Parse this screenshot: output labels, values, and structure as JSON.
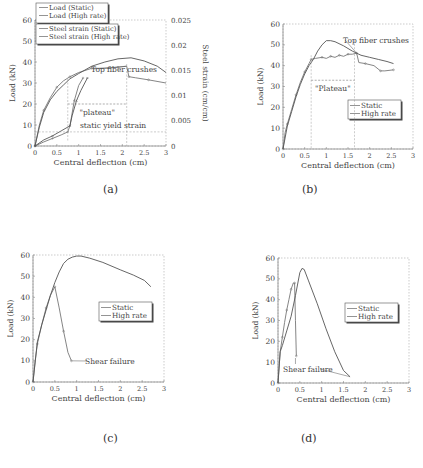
{
  "chart_data": [
    {
      "id": "a",
      "type": "line",
      "caption": "(a)",
      "xlabel": "Central deflection (cm)",
      "ylabel": "Load (kN)",
      "y2label": "Steel strain (cm/cm)",
      "xlim": [
        0,
        3
      ],
      "ylim": [
        0,
        60
      ],
      "y2lim": [
        0,
        0.025
      ],
      "xticks": [
        "0",
        "0.5",
        "1",
        "1.5",
        "2",
        "2.5",
        "3"
      ],
      "yticks": [
        "0",
        "10",
        "20",
        "30",
        "40",
        "50",
        "60"
      ],
      "y2ticks": [
        "0",
        "0.005",
        "0.01",
        "0.015",
        "0.02",
        "0.025"
      ],
      "grid": "dotted",
      "legend": [
        "Load (Static)",
        "Load (High rate)",
        "Steel strain (Static)",
        "Steel strain (High rate)"
      ],
      "legend_position": "top-left",
      "series": [
        {
          "name": "Load (Static)",
          "axis": "left",
          "x": [
            0,
            0.1,
            0.2,
            0.35,
            0.5,
            0.65,
            0.8,
            1.0,
            1.3,
            1.6,
            1.9,
            2.1,
            2.15,
            2.3,
            2.6,
            3.0
          ],
          "y": [
            0,
            10,
            17,
            23,
            28,
            31,
            33,
            35,
            37,
            37,
            37.5,
            38,
            33,
            32.5,
            31.5,
            30
          ]
        },
        {
          "name": "Load (High rate)",
          "axis": "left",
          "x": [
            0,
            0.1,
            0.2,
            0.35,
            0.5,
            0.65,
            0.8,
            1.0,
            1.3,
            1.6,
            1.9,
            2.2,
            2.5,
            2.8,
            3.0
          ],
          "y": [
            0,
            9,
            16,
            22,
            26,
            29,
            32,
            34.5,
            38,
            40,
            41.5,
            42,
            40.5,
            38,
            35
          ]
        },
        {
          "name": "Steel strain (Static)",
          "axis": "right",
          "x": [
            0,
            0.2,
            0.4,
            0.6,
            0.75,
            0.8,
            0.9,
            1.0,
            1.1
          ],
          "y": [
            0,
            0.0008,
            0.0015,
            0.0022,
            0.0028,
            0.004,
            0.009,
            0.012,
            0.0135
          ]
        },
        {
          "name": "Steel strain (High rate)",
          "axis": "right",
          "x": [
            0,
            0.2,
            0.4,
            0.6,
            0.8,
            0.85,
            0.95,
            1.05,
            1.2
          ],
          "y": [
            0,
            0.0012,
            0.002,
            0.003,
            0.004,
            0.006,
            0.009,
            0.011,
            0.0135
          ]
        }
      ],
      "annotations": [
        {
          "text": "Top fiber crushes",
          "x": 2.1,
          "y": 38
        },
        {
          "text": "\"plateau\"",
          "x_range": [
            0.75,
            2.1
          ],
          "y": 20
        },
        {
          "text": "static yield strain",
          "y2": 0.0028
        }
      ]
    },
    {
      "id": "b",
      "type": "line",
      "caption": "(b)",
      "xlabel": "Central deflection (cm)",
      "ylabel": "Load (kN)",
      "xlim": [
        0,
        3
      ],
      "ylim": [
        0,
        60
      ],
      "xticks": [
        "0",
        "0.5",
        "1",
        "1.5",
        "2",
        "2.5",
        "3"
      ],
      "yticks": [
        "0",
        "10",
        "20",
        "30",
        "40",
        "50",
        "60"
      ],
      "grid": "dotted",
      "legend": [
        "Static",
        "High rate"
      ],
      "legend_position": "lower-right",
      "series": [
        {
          "name": "Static",
          "x": [
            0,
            0.05,
            0.1,
            0.2,
            0.3,
            0.4,
            0.5,
            0.6,
            0.65,
            0.75,
            0.9,
            1.0,
            1.1,
            1.2,
            1.3,
            1.4,
            1.5,
            1.6,
            1.7,
            1.75,
            1.9,
            2.1,
            2.25,
            2.35,
            2.55
          ],
          "y": [
            0,
            8,
            12,
            19,
            26,
            32,
            37,
            41,
            43,
            43.5,
            44,
            43.5,
            44.5,
            44,
            45,
            44.5,
            45.5,
            45.5,
            46,
            41.5,
            41,
            40,
            37.5,
            37.5,
            38
          ]
        },
        {
          "name": "High rate",
          "x": [
            0,
            0.1,
            0.2,
            0.3,
            0.4,
            0.5,
            0.6,
            0.7,
            0.8,
            0.9,
            1.0,
            1.1,
            1.2,
            1.4,
            1.6,
            1.8,
            2.0,
            2.2,
            2.4,
            2.55
          ],
          "y": [
            0,
            11,
            18,
            25,
            31,
            36,
            40,
            43,
            47,
            50,
            52,
            52,
            51.5,
            49.5,
            47,
            45,
            44,
            43,
            42,
            41
          ]
        }
      ],
      "annotations": [
        {
          "text": "Top fiber crushes",
          "x": 1.7,
          "y": 46
        },
        {
          "text": "\"Plateau\"",
          "x_range": [
            0.65,
            1.65
          ],
          "y": 33
        }
      ]
    },
    {
      "id": "c",
      "type": "line",
      "caption": "(c)",
      "xlabel": "Central deflection (cm)",
      "ylabel": "Load (kN)",
      "xlim": [
        0,
        3
      ],
      "ylim": [
        0,
        60
      ],
      "xticks": [
        "0",
        "0.5",
        "1",
        "1.5",
        "2",
        "2.5",
        "3"
      ],
      "yticks": [
        "0",
        "10",
        "20",
        "30",
        "40",
        "50",
        "60"
      ],
      "grid": "dotted",
      "legend": [
        "Static",
        "High rate"
      ],
      "legend_position": "right",
      "series": [
        {
          "name": "Static",
          "x": [
            0,
            0.05,
            0.1,
            0.2,
            0.3,
            0.4,
            0.5,
            0.6,
            0.7,
            0.8,
            0.88
          ],
          "y": [
            0,
            10,
            18,
            27,
            35,
            41,
            45,
            35,
            24,
            14,
            10
          ]
        },
        {
          "name": "High rate",
          "x": [
            0,
            0.1,
            0.2,
            0.3,
            0.4,
            0.5,
            0.6,
            0.7,
            0.8,
            0.9,
            1.0,
            1.1,
            1.3,
            1.6,
            2.0,
            2.3,
            2.55,
            2.7
          ],
          "y": [
            0,
            19,
            27,
            34,
            41,
            47,
            52,
            56,
            58,
            59,
            59.5,
            59.5,
            58.5,
            56.5,
            53,
            50.5,
            48,
            45
          ]
        }
      ],
      "annotations": [
        {
          "text": "Shear failure",
          "x": 0.9,
          "y": 10
        }
      ]
    },
    {
      "id": "d",
      "type": "line",
      "caption": "(d)",
      "xlabel": "Central deflection (cm)",
      "ylabel": "Load (kN)",
      "xlim": [
        0,
        3
      ],
      "ylim": [
        0,
        60
      ],
      "xticks": [
        "0",
        "0.5",
        "1",
        "1.5",
        "2",
        "2.5",
        "3"
      ],
      "yticks": [
        "0",
        "10",
        "20",
        "30",
        "40",
        "50",
        "60"
      ],
      "grid": "dotted",
      "legend": [
        "Static",
        "High rate"
      ],
      "legend_position": "right",
      "series": [
        {
          "name": "Static",
          "x": [
            0,
            0.05,
            0.1,
            0.15,
            0.2,
            0.25,
            0.3,
            0.35,
            0.38,
            0.4,
            0.42
          ],
          "y": [
            0,
            15,
            22,
            29,
            35,
            40,
            45,
            48,
            48,
            30,
            13
          ]
        },
        {
          "name": "High rate",
          "x": [
            0,
            0.05,
            0.1,
            0.2,
            0.3,
            0.4,
            0.5,
            0.55,
            0.6,
            0.7,
            0.9,
            1.1,
            1.3,
            1.5,
            1.65
          ],
          "y": [
            0,
            15,
            18,
            25,
            32,
            42,
            53,
            55,
            54.5,
            49,
            38,
            26,
            15,
            6,
            3
          ]
        }
      ],
      "annotations": [
        {
          "text": "Shear failure",
          "x": 0.4,
          "y": 12
        },
        {
          "text": "Shear failure",
          "x": 1.65,
          "y": 3
        }
      ]
    }
  ]
}
